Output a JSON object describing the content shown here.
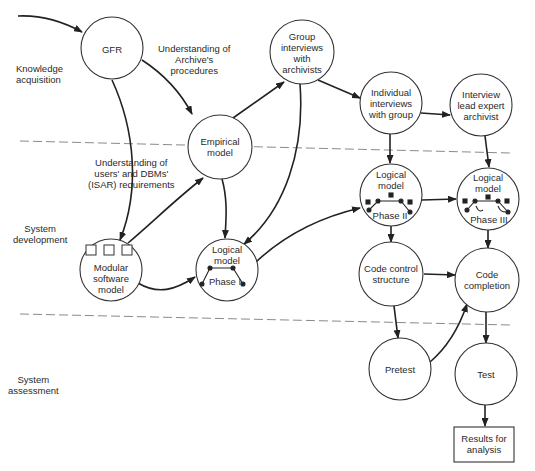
{
  "phases": [
    {
      "id": "knowledge",
      "label": "Knowledge\nacquisition"
    },
    {
      "id": "development",
      "label": "System\ndevelopment"
    },
    {
      "id": "assessment",
      "label": "System\nassessment"
    }
  ],
  "nodes": {
    "gfr": {
      "label": "GFR"
    },
    "empirical": {
      "label": "Empirical\nmodel"
    },
    "group": {
      "label": "Group\ninterviews\nwith\narchivists"
    },
    "individual": {
      "label": "Individual\ninterviews\nwith group"
    },
    "lead": {
      "label": "Interview\nlead expert\narchivist"
    },
    "modular": {
      "label": "Modular\nsoftware\nmodel"
    },
    "phase1": {
      "label": "Logical\nmodel",
      "sub": "Phase I"
    },
    "phase2": {
      "label": "Logical\nmodel",
      "sub": "Phase II"
    },
    "phase3": {
      "label": "Logical\nmodel",
      "sub": "Phase III"
    },
    "code_control": {
      "label": "Code control\nstructure"
    },
    "code_completion": {
      "label": "Code\ncompletion"
    },
    "pretest": {
      "label": "Pretest"
    },
    "test": {
      "label": "Test"
    },
    "results": {
      "label": "Results for\nanalysis"
    }
  },
  "edge_labels": {
    "archive": "Understanding of\nArchive's\nprocedures",
    "users": "Understanding of\nusers' and DBMs'\n(ISAR) requirements"
  },
  "edges": [
    [
      "start",
      "gfr"
    ],
    [
      "gfr",
      "empirical"
    ],
    [
      "gfr",
      "modular"
    ],
    [
      "empirical",
      "group"
    ],
    [
      "empirical",
      "phase1"
    ],
    [
      "modular",
      "empirical"
    ],
    [
      "modular",
      "phase1"
    ],
    [
      "group",
      "phase1"
    ],
    [
      "group",
      "individual"
    ],
    [
      "individual",
      "lead"
    ],
    [
      "individual",
      "phase2"
    ],
    [
      "lead",
      "phase3"
    ],
    [
      "phase1",
      "phase2"
    ],
    [
      "phase2",
      "phase3"
    ],
    [
      "phase2",
      "code_control"
    ],
    [
      "phase3",
      "code_completion"
    ],
    [
      "code_control",
      "code_completion"
    ],
    [
      "code_control",
      "pretest"
    ],
    [
      "pretest",
      "code_completion"
    ],
    [
      "code_completion",
      "test"
    ],
    [
      "test",
      "results"
    ]
  ]
}
